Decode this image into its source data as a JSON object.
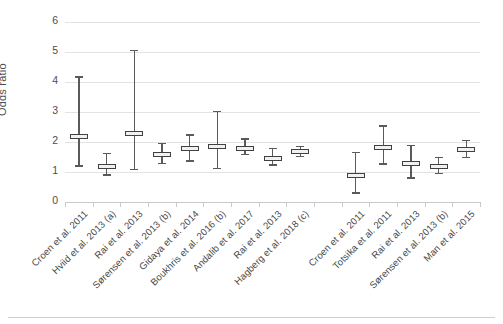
{
  "chart_data": {
    "type": "scatter",
    "title": "",
    "subtitle": "",
    "xlabel": "",
    "ylabel": "Odds ratio*",
    "ylabel_text": "Odds ratio",
    "ylabel_superscript": "*",
    "ylim": [
      0,
      6
    ],
    "yticks": [
      0,
      1,
      2,
      3,
      4,
      5,
      6
    ],
    "ytick_labels": [
      "0",
      "1",
      "2",
      "3",
      "4",
      "5",
      "6"
    ],
    "grid": true,
    "grid_axis": "y",
    "legend": "none",
    "marker_style": "point-estimate-box-with-95CI-whiskers",
    "error_bar_label": "95% confidence interval",
    "group_gap_after_index": 8,
    "categories": [
      "Croen et al. 2011",
      "Hviid et al. 2013 (a)",
      "Rai et al. 2013",
      "Sørensen et al. 2013 (b)",
      "Gidaya et al. 2014",
      "Boukhris et al. 2016 (b)",
      "Andalib et al. 2017",
      "Rai et al. 2013",
      "Hagberg et al. 2018 (c)",
      "Croen et al. 2011",
      "Totsika et al. 2011",
      "Rai et al. 2013",
      "Sørensen et al. 2013 (b)",
      "Man et al. 2015"
    ],
    "points": [
      {
        "label": "Croen et al. 2011",
        "slot": 1,
        "value": 2.19,
        "low": 1.2,
        "high": 4.17
      },
      {
        "label": "Hviid et al. 2013 (a)",
        "slot": 2,
        "value": 1.2,
        "low": 0.9,
        "high": 1.61
      },
      {
        "label": "Rai et al. 2013",
        "slot": 3,
        "value": 2.3,
        "low": 1.08,
        "high": 5.05
      },
      {
        "label": "Sørensen et al. 2013 (b)",
        "slot": 4,
        "value": 1.58,
        "low": 1.29,
        "high": 1.96
      },
      {
        "label": "Gidaya et al. 2014",
        "slot": 5,
        "value": 1.78,
        "low": 1.37,
        "high": 2.23
      },
      {
        "label": "Boukhris et al. 2016 (b)",
        "slot": 6,
        "value": 1.85,
        "low": 1.12,
        "high": 3.01
      },
      {
        "label": "Andalib et al. 2017",
        "slot": 7,
        "value": 1.8,
        "low": 1.58,
        "high": 2.1
      },
      {
        "label": "Rai et al. 2013",
        "slot": 8,
        "value": 1.45,
        "low": 1.23,
        "high": 1.78
      },
      {
        "label": "Hagberg et al. 2018 (c)",
        "slot": 9,
        "value": 1.67,
        "low": 1.52,
        "high": 1.86
      },
      {
        "label": "Croen et al. 2011",
        "slot": 11,
        "value": 0.87,
        "low": 0.3,
        "high": 1.65
      },
      {
        "label": "Totsika et al. 2011",
        "slot": 12,
        "value": 1.81,
        "low": 1.27,
        "high": 2.53
      },
      {
        "label": "Rai et al. 2013",
        "slot": 13,
        "value": 1.29,
        "low": 0.8,
        "high": 1.88
      },
      {
        "label": "Sørensen et al. 2013 (b)",
        "slot": 14,
        "value": 1.17,
        "low": 0.96,
        "high": 1.48
      },
      {
        "label": "Man et al. 2015",
        "slot": 15,
        "value": 1.74,
        "low": 1.49,
        "high": 2.04
      }
    ]
  },
  "colors": {
    "background": "#ffffff",
    "gridline": "#e3e3e3",
    "axis": "#c9c9c9",
    "marker_line": "#404040",
    "whisker": "#5a5a5a",
    "text": "#4a4a4a"
  }
}
